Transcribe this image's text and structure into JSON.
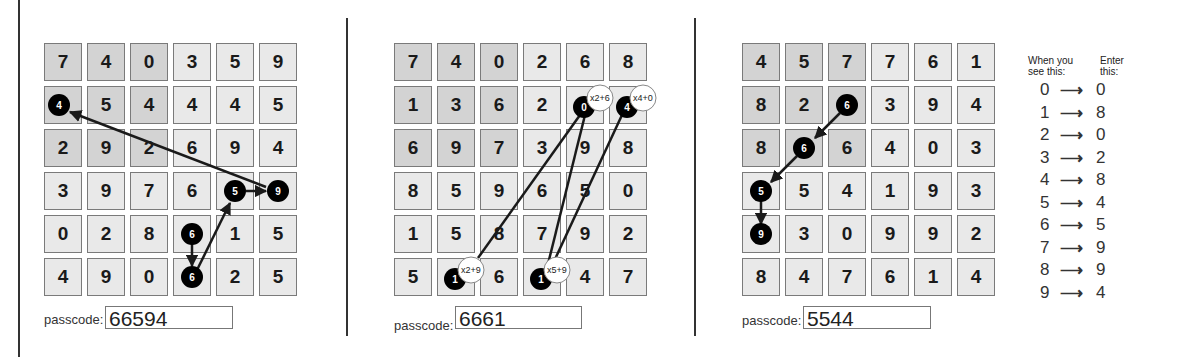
{
  "panels": [
    {
      "id": "panel-1",
      "grid": [
        [
          7,
          4,
          0,
          3,
          5,
          9
        ],
        [
          4,
          5,
          4,
          4,
          4,
          5
        ],
        [
          2,
          9,
          2,
          6,
          9,
          4
        ],
        [
          3,
          9,
          7,
          6,
          5,
          9
        ],
        [
          0,
          2,
          8,
          6,
          1,
          5
        ],
        [
          4,
          9,
          0,
          6,
          2,
          5
        ]
      ],
      "shaded_block": "rows 0-2, cols 0-2",
      "markers": [
        {
          "row": 4,
          "col": 3,
          "value": "6"
        },
        {
          "row": 5,
          "col": 3,
          "value": "6"
        },
        {
          "row": 3,
          "col": 4,
          "value": "5"
        },
        {
          "row": 3,
          "col": 5,
          "value": "9"
        },
        {
          "row": 1,
          "col": 0,
          "value": "4"
        }
      ],
      "passcode_label": "passcode:",
      "passcode_value": "66594"
    },
    {
      "id": "panel-2",
      "grid": [
        [
          7,
          4,
          0,
          2,
          6,
          8
        ],
        [
          1,
          3,
          6,
          2,
          0,
          4
        ],
        [
          6,
          9,
          7,
          3,
          9,
          8
        ],
        [
          8,
          5,
          9,
          6,
          5,
          0
        ],
        [
          1,
          5,
          8,
          7,
          9,
          2
        ],
        [
          5,
          1,
          6,
          1,
          4,
          7
        ]
      ],
      "shaded_block": "rows 0-2, cols 0-2",
      "markers": [
        {
          "row": 5,
          "col": 1,
          "value": "1",
          "formula": "x2+9"
        },
        {
          "row": 5,
          "col": 3,
          "value": "1",
          "formula": "x5+9"
        },
        {
          "row": 1,
          "col": 4,
          "value": "0",
          "formula": "x2+6"
        },
        {
          "row": 1,
          "col": 5,
          "value": "4",
          "formula": "x4+0"
        }
      ],
      "passcode_label": "passcode:",
      "passcode_value": "6661"
    },
    {
      "id": "panel-3",
      "grid": [
        [
          4,
          5,
          7,
          7,
          6,
          1
        ],
        [
          8,
          2,
          6,
          3,
          9,
          4
        ],
        [
          8,
          6,
          6,
          4,
          0,
          3
        ],
        [
          5,
          5,
          4,
          1,
          9,
          3
        ],
        [
          9,
          3,
          0,
          9,
          9,
          2
        ],
        [
          8,
          4,
          7,
          6,
          1,
          4
        ]
      ],
      "shaded_block": "rows 0-2, cols 0-2",
      "markers": [
        {
          "row": 1,
          "col": 2,
          "value": "6"
        },
        {
          "row": 2,
          "col": 1,
          "value": "6"
        },
        {
          "row": 3,
          "col": 0,
          "value": "5"
        },
        {
          "row": 4,
          "col": 0,
          "value": "9"
        }
      ],
      "passcode_label": "passcode:",
      "passcode_value": "5544"
    }
  ],
  "legend": {
    "header_left": "When you see this:",
    "header_left_line1": "When you",
    "header_left_line2": "see this:",
    "header_right_line1": "Enter",
    "header_right_line2": "this:",
    "arrow": "⟶",
    "rows": [
      {
        "see": "0",
        "enter": "0"
      },
      {
        "see": "1",
        "enter": "8"
      },
      {
        "see": "2",
        "enter": "0"
      },
      {
        "see": "3",
        "enter": "2"
      },
      {
        "see": "4",
        "enter": "8"
      },
      {
        "see": "5",
        "enter": "4"
      },
      {
        "see": "6",
        "enter": "5"
      },
      {
        "see": "7",
        "enter": "9"
      },
      {
        "see": "8",
        "enter": "9"
      },
      {
        "see": "9",
        "enter": "4"
      }
    ]
  },
  "colors": {
    "cell_light": "#e9e9e9",
    "cell_shaded": "#d3d3d3",
    "cell_border": "#7a7a7a",
    "marker_fill": "#000000",
    "line": "#1a1a1a"
  }
}
